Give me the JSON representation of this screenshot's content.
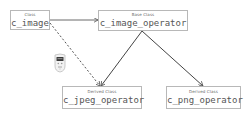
{
  "diagram": {
    "type": "class-diagram",
    "nodes": [
      {
        "id": "c_image",
        "kind_label": "Class",
        "name": "c_image"
      },
      {
        "id": "c_image_operator",
        "kind_label": "Base Class",
        "name": "c_image_operator"
      },
      {
        "id": "c_jpeg_operator",
        "kind_label": "Derived Class",
        "name": "c_jpeg_operator"
      },
      {
        "id": "c_png_operator",
        "kind_label": "Derived Class",
        "name": "c_png_operator"
      }
    ],
    "edges": [
      {
        "from": "c_image",
        "to": "c_image_operator",
        "style": "solid",
        "arrow": "open"
      },
      {
        "from": "c_image",
        "to": "c_jpeg_operator",
        "style": "dashed",
        "arrow": "open"
      },
      {
        "from": "c_image_operator",
        "to": "c_jpeg_operator",
        "style": "solid",
        "arrow": "open"
      },
      {
        "from": "c_image_operator",
        "to": "c_png_operator",
        "style": "solid",
        "arrow": "open"
      }
    ],
    "icons": [
      {
        "name": "robot-icon"
      }
    ],
    "colors": {
      "box_border": "#b8b8b8",
      "text": "#555555",
      "line": "#555555"
    }
  }
}
